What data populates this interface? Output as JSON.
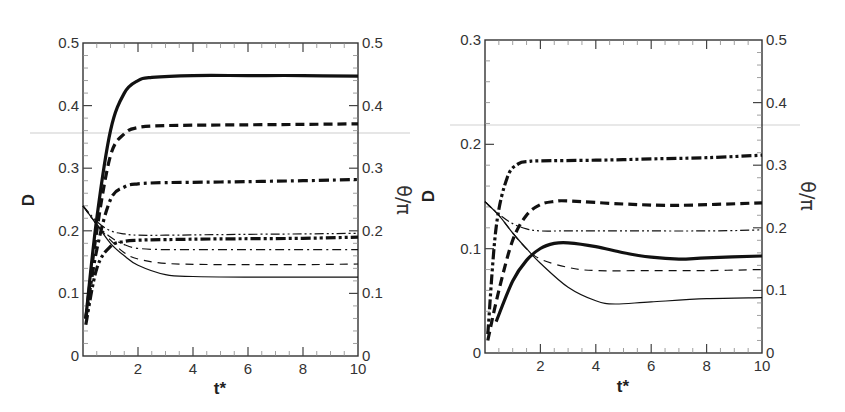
{
  "chart_data": [
    {
      "type": "line",
      "panel": "left",
      "xlabel": "t*",
      "ylabel": "D",
      "ylabel_right": "θ/π",
      "xlim": [
        0,
        10
      ],
      "ylim": [
        0,
        0.5
      ],
      "ylim_right": [
        0,
        0.5
      ],
      "xticks": [
        "2",
        "4",
        "6",
        "8",
        "10"
      ],
      "yticks": [
        "0",
        "0.1",
        "0.2",
        "0.3",
        "0.4",
        "0.5"
      ],
      "yticks_right": [
        "0",
        "0.1",
        "0.2",
        "0.3",
        "0.4",
        "0.5"
      ],
      "grid": false,
      "legend": "none",
      "series": [
        {
          "name": "θ/π thick solid",
          "axis": "right",
          "style": "solid",
          "weight": "thick",
          "x": [
            0.1,
            0.5,
            1.0,
            1.5,
            2.0,
            2.5,
            4,
            6,
            8,
            10
          ],
          "y": [
            0.06,
            0.22,
            0.36,
            0.42,
            0.44,
            0.445,
            0.448,
            0.448,
            0.448,
            0.447
          ]
        },
        {
          "name": "θ/π thick dashed",
          "axis": "right",
          "style": "dashed",
          "weight": "thick",
          "x": [
            0.1,
            0.5,
            1.0,
            1.5,
            2.0,
            3,
            5,
            8,
            10
          ],
          "y": [
            0.06,
            0.2,
            0.32,
            0.355,
            0.365,
            0.368,
            0.369,
            0.37,
            0.371
          ]
        },
        {
          "name": "θ/π thick dash-dot",
          "axis": "right",
          "style": "dash-dot",
          "weight": "thick",
          "x": [
            0.1,
            0.5,
            1.0,
            1.5,
            2.0,
            3,
            5,
            8,
            10
          ],
          "y": [
            0.06,
            0.17,
            0.25,
            0.27,
            0.275,
            0.277,
            0.278,
            0.28,
            0.282
          ]
        },
        {
          "name": "θ/π thick dash-dot-dot",
          "axis": "right",
          "style": "dash-dot-dot",
          "weight": "thick",
          "x": [
            0.1,
            0.5,
            1.0,
            1.5,
            2.0,
            3,
            5,
            8,
            10
          ],
          "y": [
            0.05,
            0.14,
            0.175,
            0.183,
            0.185,
            0.186,
            0.187,
            0.188,
            0.19
          ]
        },
        {
          "name": "D thin solid",
          "axis": "left",
          "style": "solid",
          "weight": "thin",
          "x": [
            0,
            0.5,
            1.0,
            1.5,
            2.0,
            3,
            4,
            6,
            8,
            10
          ],
          "y": [
            0.24,
            0.21,
            0.18,
            0.16,
            0.145,
            0.13,
            0.127,
            0.126,
            0.126,
            0.126
          ]
        },
        {
          "name": "D thin dashed",
          "axis": "left",
          "style": "dashed",
          "weight": "thin",
          "x": [
            0,
            0.5,
            1.0,
            1.5,
            2.0,
            3,
            5,
            8,
            10
          ],
          "y": [
            0.24,
            0.21,
            0.185,
            0.165,
            0.155,
            0.148,
            0.146,
            0.146,
            0.147
          ]
        },
        {
          "name": "D thin dash-dot",
          "axis": "left",
          "style": "dash-dot",
          "weight": "thin",
          "x": [
            0,
            0.5,
            1.0,
            1.5,
            2.0,
            3,
            5,
            8,
            10
          ],
          "y": [
            0.24,
            0.21,
            0.19,
            0.178,
            0.172,
            0.17,
            0.17,
            0.17,
            0.17
          ]
        },
        {
          "name": "D thin dash-dot-dot",
          "axis": "left",
          "style": "dash-dot-dot",
          "weight": "thin",
          "x": [
            0,
            0.5,
            1.0,
            1.5,
            2.0,
            3,
            5,
            8,
            10
          ],
          "y": [
            0.24,
            0.215,
            0.2,
            0.195,
            0.193,
            0.193,
            0.194,
            0.195,
            0.196
          ]
        }
      ]
    },
    {
      "type": "line",
      "panel": "right",
      "xlabel": "t*",
      "ylabel": "D",
      "ylabel_right": "θ/π",
      "xlim": [
        0,
        10
      ],
      "ylim": [
        0,
        0.3
      ],
      "ylim_right": [
        0,
        0.5
      ],
      "xticks": [
        "2",
        "4",
        "6",
        "8",
        "10"
      ],
      "yticks": [
        "0",
        "0.1",
        "0.2",
        "0.3"
      ],
      "yticks_right": [
        "0",
        "0.1",
        "0.2",
        "0.3",
        "0.4",
        "0.5"
      ],
      "grid": false,
      "legend": "none",
      "series": [
        {
          "name": "θ/π thick dash-dot-dot",
          "axis": "right",
          "style": "dash-dot-dot",
          "weight": "thick",
          "x": [
            0.1,
            0.4,
            0.8,
            1.2,
            1.6,
            2.0,
            4,
            6,
            8,
            10
          ],
          "y": [
            0.03,
            0.2,
            0.28,
            0.302,
            0.306,
            0.307,
            0.308,
            0.31,
            0.312,
            0.316
          ]
        },
        {
          "name": "θ/π thick dashed",
          "axis": "right",
          "style": "dashed",
          "weight": "thick",
          "x": [
            0.1,
            0.5,
            1.0,
            1.5,
            2.0,
            2.5,
            3,
            5,
            7,
            10
          ],
          "y": [
            0.02,
            0.1,
            0.18,
            0.22,
            0.237,
            0.242,
            0.243,
            0.238,
            0.236,
            0.24
          ]
        },
        {
          "name": "θ/π thick solid",
          "axis": "right",
          "style": "solid",
          "weight": "thick",
          "x": [
            0.4,
            1.0,
            1.5,
            2.0,
            2.5,
            3.0,
            4.0,
            5.0,
            6.0,
            7.0,
            8.0,
            10
          ],
          "y": [
            0.05,
            0.115,
            0.148,
            0.167,
            0.175,
            0.176,
            0.17,
            0.16,
            0.153,
            0.15,
            0.152,
            0.155
          ]
        },
        {
          "name": "D thin solid",
          "axis": "left",
          "style": "solid",
          "weight": "thin",
          "x": [
            0,
            0.5,
            1.0,
            1.5,
            2.0,
            3.0,
            4.0,
            4.7,
            6.0,
            8.0,
            10
          ],
          "y": [
            0.145,
            0.132,
            0.115,
            0.1,
            0.086,
            0.063,
            0.05,
            0.047,
            0.049,
            0.052,
            0.053
          ]
        },
        {
          "name": "D thin dashed",
          "axis": "left",
          "style": "dashed",
          "weight": "thin",
          "x": [
            0,
            0.5,
            1.0,
            1.5,
            2.0,
            3.0,
            4.0,
            6.0,
            8.0,
            10
          ],
          "y": [
            0.145,
            0.132,
            0.115,
            0.1,
            0.09,
            0.082,
            0.079,
            0.079,
            0.079,
            0.08
          ]
        },
        {
          "name": "D thin dash-dot-dot",
          "axis": "left",
          "style": "dash-dot-dot",
          "weight": "thin",
          "x": [
            0,
            0.5,
            1.0,
            1.5,
            2.0,
            3.0,
            5.0,
            8.0,
            10
          ],
          "y": [
            0.145,
            0.133,
            0.124,
            0.119,
            0.117,
            0.117,
            0.117,
            0.117,
            0.118
          ]
        }
      ]
    }
  ]
}
